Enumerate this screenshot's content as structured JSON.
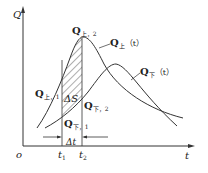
{
  "diagram": {
    "axes": {
      "y_label": "Q",
      "x_label": "t",
      "origin_label": "o"
    },
    "curves": [
      {
        "name": "upstream-hydrograph",
        "label_main": "Q",
        "label_sub": "上",
        "label_arg": "（t）"
      },
      {
        "name": "downstream-hydrograph",
        "label_main": "Q",
        "label_sub": "下",
        "label_arg": "（t）"
      }
    ],
    "annotations": {
      "q_up_2": {
        "main": "Q",
        "sub": "上，2"
      },
      "q_up_1": {
        "main": "Q",
        "sub": "上，1"
      },
      "q_down_2": {
        "main": "Q",
        "sub": "下，2"
      },
      "q_down_1": {
        "main": "Q",
        "sub": "下，1"
      },
      "delta_s": "ΔS",
      "delta_t": "Δt",
      "t1": {
        "main": "t",
        "sub": "1"
      },
      "t2": {
        "main": "t",
        "sub": "2"
      }
    },
    "colors": {
      "line": "#333333",
      "background": "#ffffff"
    }
  }
}
